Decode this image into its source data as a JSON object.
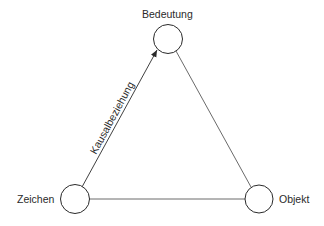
{
  "diagram": {
    "type": "semiotic-triangle",
    "nodes": [
      {
        "id": "bedeutung",
        "label": "Bedeutung",
        "cx": 168,
        "cy": 39,
        "r": 14
      },
      {
        "id": "zeichen",
        "label": "Zeichen",
        "cx": 75,
        "cy": 199,
        "r": 14
      },
      {
        "id": "objekt",
        "label": "Objekt",
        "cx": 259,
        "cy": 199,
        "r": 14
      }
    ],
    "edges": [
      {
        "from": "zeichen",
        "to": "bedeutung",
        "label": "Kausalbeziehung",
        "arrow": "end"
      },
      {
        "from": "bedeutung",
        "to": "objekt",
        "label": "",
        "arrow": "none"
      },
      {
        "from": "zeichen",
        "to": "objekt",
        "label": "",
        "arrow": "none"
      }
    ],
    "colors": {
      "stroke": "#2a2a2a",
      "background": "#ffffff"
    }
  }
}
